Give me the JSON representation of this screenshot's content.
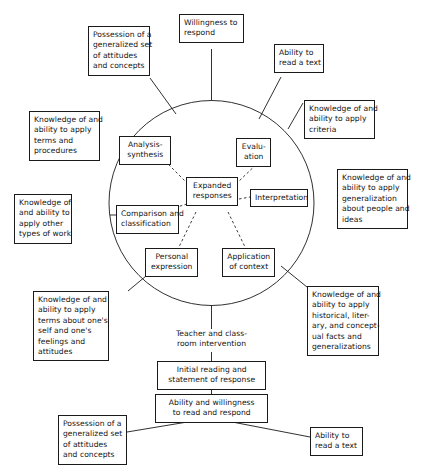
{
  "diagram": {
    "stroke_color": "#1a1a1a",
    "text_color": "#141414",
    "background_color": "#ffffff",
    "core": {
      "label": "Expanded responses",
      "lines": [
        "Expanded",
        "responses"
      ]
    },
    "circle_label": "process circle",
    "inner_nodes": [
      {
        "id": "analysis-synthesis",
        "label": "Analysis-synthesis",
        "lines": [
          "Analysis-",
          "synthesis"
        ]
      },
      {
        "id": "evaluation",
        "label": "Evaluation",
        "lines": [
          "Evalu-",
          "ation"
        ]
      },
      {
        "id": "interpretation",
        "label": "Interpretation",
        "lines": [
          "Interpretation"
        ]
      },
      {
        "id": "application-of-context",
        "label": "Application of context",
        "lines": [
          "Application",
          "of context"
        ]
      },
      {
        "id": "personal-expression",
        "label": "Personal expression",
        "lines": [
          "Personal",
          "expression"
        ]
      },
      {
        "id": "comparison-and-classification",
        "label": "Comparison and classification",
        "lines": [
          "Comparison and",
          "classification"
        ]
      }
    ],
    "outer_nodes": [
      {
        "id": "possession-generalized-set-top",
        "label": "Possession of a generalized set of attitudes and concepts",
        "lines": [
          "Possession of a",
          "generalized set",
          "of attitudes",
          "and concepts"
        ]
      },
      {
        "id": "willingness-to-respond",
        "label": "Willingness to respond",
        "lines": [
          "Willingness to",
          "respond"
        ]
      },
      {
        "id": "ability-to-read-a-text-top",
        "label": "Ability to read a text",
        "lines": [
          "Ability to",
          "read a text"
        ]
      },
      {
        "id": "knowledge-apply-criteria",
        "label": "Knowledge of and ability to apply criteria",
        "lines": [
          "Knowledge of and",
          "ability to apply",
          "criteria"
        ]
      },
      {
        "id": "knowledge-apply-generalization",
        "label": "Knowledge of and ability to apply generalization about people and ideas",
        "lines": [
          "Knowledge of and",
          "ability to apply",
          "generalization",
          "about people and",
          "ideas"
        ]
      },
      {
        "id": "knowledge-apply-terms-procedures",
        "label": "Knowledge of and ability to apply terms and procedures",
        "lines": [
          "Knowledge of and",
          "ability to apply",
          "terms and",
          "procedures"
        ]
      },
      {
        "id": "knowledge-apply-other-types-of-work",
        "label": "Knowledge of and ability to apply other types of work",
        "lines": [
          "Knowledge of",
          "and ability to",
          "apply other",
          "types of work"
        ]
      },
      {
        "id": "knowledge-apply-terms-about-self",
        "label": "Knowledge of and ability to apply terms about one's self and one's feelings and attitudes",
        "lines": [
          "Knowledge of and",
          "ability to apply",
          "terms about one's",
          "self and one's",
          "feelings and",
          "attitudes"
        ]
      },
      {
        "id": "knowledge-apply-historical-literary",
        "label": "Knowledge of and ability to apply historical, literary, and conceptual facts and generalizations",
        "lines": [
          "Knowledge of and",
          "ability to apply",
          "historical, liter-",
          "ary, and concept-",
          "ual facts and",
          "generalizations"
        ]
      }
    ],
    "flow_nodes": [
      {
        "id": "teacher-and-classroom-intervention",
        "label": "Teacher and classroom intervention",
        "lines": [
          "Teacher and class-",
          "room intervention"
        ],
        "boxed": false
      },
      {
        "id": "initial-reading-and-statement-of-response",
        "label": "Initial reading and statement of response",
        "lines": [
          "Initial reading and",
          "statement of response"
        ],
        "boxed": true
      },
      {
        "id": "ability-and-willingness-to-read-and-respond",
        "label": "Ability and willingness to read and respond",
        "lines": [
          "Ability and willingness",
          "to read and respond"
        ],
        "boxed": true
      },
      {
        "id": "possession-generalized-set-bottom",
        "label": "Possession of a generalized set of attitudes and concepts",
        "lines": [
          "Possession of a",
          "generalized set",
          "of attitudes",
          "and concepts"
        ],
        "boxed": true
      },
      {
        "id": "ability-to-read-a-text-bottom",
        "label": "Ability to read a text",
        "lines": [
          "Ability to",
          "read a text"
        ],
        "boxed": true
      }
    ]
  }
}
